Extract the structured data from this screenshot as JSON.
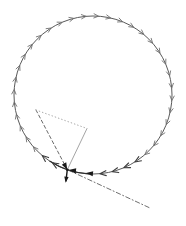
{
  "figure": {
    "width": 186,
    "height": 226,
    "background": "#ffffff",
    "alt": "Phase-portrait diagram: a circle traced by small clockwise arrowheads converging on a bold equilibrium point at the lower left, with dashed, dotted and solid construction lines and a short downward arrow at the point"
  },
  "circle": {
    "cx": 93,
    "cy": 95,
    "r": 79,
    "color": "#5a5a5a",
    "stroke_width": 1
  },
  "emphasis_arc": {
    "start_deg": 93,
    "end_deg": 123,
    "color": "#2f2f2f",
    "stroke_width": 1.3
  },
  "flow_arrowheads": {
    "count": 40,
    "step_deg": 9,
    "start_deg": 4,
    "skip_deg": [
      94,
      103,
      112
    ],
    "dark_deg": [
      58,
      67,
      76,
      85,
      121,
      130
    ],
    "length": 4.6,
    "half_width": 2.1,
    "color": "#6f6f6f",
    "dark_color": "#3c3c3c",
    "stroke_width": 0.9,
    "dark_stroke_width": 1.1,
    "direction": "clockwise"
  },
  "equilibrium_point": {
    "x": 67.3,
    "y": 169.7
  },
  "construction_lines": [
    {
      "name": "dashed-line-upper-left",
      "x1": 36,
      "y1": 110,
      "x2": 67.3,
      "y2": 169.7,
      "color": "#6a6a6a",
      "width": 1,
      "dash": "3.2 2.6"
    },
    {
      "name": "dotted-line-top",
      "x1": 36,
      "y1": 110,
      "x2": 87,
      "y2": 128.5,
      "color": "#a9a9a9",
      "width": 1,
      "dash": "0.6 2.8"
    },
    {
      "name": "solid-line-right",
      "x1": 87,
      "y1": 128.5,
      "x2": 67.3,
      "y2": 169.7,
      "color": "#9a9a9a",
      "width": 0.9,
      "dash": ""
    },
    {
      "name": "dashdot-line-lower-right",
      "x1": 68.7,
      "y1": 170.3,
      "x2": 150,
      "y2": 208,
      "color": "#6f6f6f",
      "width": 1,
      "dash": "4.5 2.5 1 2.5"
    }
  ],
  "bold_arrows": {
    "color": "#1a1a1a",
    "items": [
      {
        "name": "dashed-line-arrowhead-at-point",
        "tip_x": 67.3,
        "tip_y": 169.7,
        "angle_deg": 62,
        "length": 7,
        "half_width": 2.5
      },
      {
        "name": "flow-arrowhead-at-point",
        "tip_x": 68.5,
        "tip_y": 170.1,
        "angle_deg": 186,
        "length": 7.5,
        "half_width": 2.6
      },
      {
        "name": "flow-arrowhead-bottom-arc",
        "tip_x": 86,
        "tip_y": 172.9,
        "angle_deg": 187,
        "length": 7,
        "half_width": 2.4
      },
      {
        "name": "downward-arrow",
        "tip_x": 65.7,
        "tip_y": 182.8,
        "angle_deg": 97,
        "length": 6,
        "half_width": 2.2,
        "shaft_x": 67.3,
        "shaft_y": 169.7,
        "shaft_width": 1.4
      }
    ]
  }
}
